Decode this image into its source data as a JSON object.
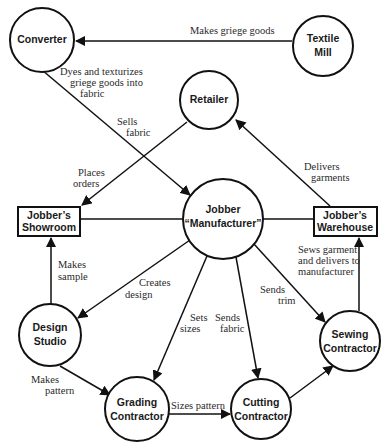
{
  "diagram": {
    "type": "flow-network",
    "nodes": {
      "converter": {
        "lines": [
          "Converter"
        ],
        "shape": "circle"
      },
      "textile_mill": {
        "lines": [
          "Textile",
          "Mill"
        ],
        "shape": "circle"
      },
      "retailer": {
        "lines": [
          "Retailer"
        ],
        "shape": "circle"
      },
      "jobber_manufacturer": {
        "lines": [
          "Jobber",
          "“Manufacturer”"
        ],
        "shape": "circle"
      },
      "jobbers_showroom": {
        "lines": [
          "Jobber’s",
          "Showroom"
        ],
        "shape": "rectangle"
      },
      "jobbers_warehouse": {
        "lines": [
          "Jobber’s",
          "Warehouse"
        ],
        "shape": "rectangle"
      },
      "design_studio": {
        "lines": [
          "Design",
          "Studio"
        ],
        "shape": "circle"
      },
      "grading_contractor": {
        "lines": [
          "Grading",
          "Contractor"
        ],
        "shape": "circle"
      },
      "cutting_contractor": {
        "lines": [
          "Cutting",
          "Contractor"
        ],
        "shape": "circle"
      },
      "sewing_contractor": {
        "lines": [
          "Sewing",
          "Contractor"
        ],
        "shape": "circle"
      }
    },
    "edges": {
      "makes_griege": {
        "from": "textile_mill",
        "to": "converter",
        "lines": [
          "Makes griege goods"
        ]
      },
      "dyes": {
        "from": "converter",
        "to": "jobber_manufacturer",
        "lines": [
          "Dyes and texturizes",
          "griege goods into",
          "fabric"
        ]
      },
      "sells_fabric": {
        "from": "converter",
        "to": "jobber_manufacturer",
        "lines": [
          "Sells",
          "fabric"
        ]
      },
      "places_orders": {
        "from": "retailer",
        "to": "jobbers_showroom",
        "lines": [
          "Places",
          "orders"
        ]
      },
      "delivers_garments": {
        "from": "jobbers_warehouse",
        "to": "retailer",
        "lines": [
          "Delivers",
          "garments"
        ]
      },
      "makes_sample": {
        "from": "design_studio",
        "to": "jobbers_showroom",
        "lines": [
          "Makes",
          "sample"
        ]
      },
      "creates_design": {
        "from": "jobber_manufacturer",
        "to": "design_studio",
        "lines": [
          "Creates",
          "design"
        ]
      },
      "sets_sizes": {
        "from": "jobber_manufacturer",
        "to": "grading_contractor",
        "lines": [
          "Sets",
          "sizes"
        ]
      },
      "sends_fabric": {
        "from": "jobber_manufacturer",
        "to": "cutting_contractor",
        "lines": [
          "Sends",
          "fabric"
        ]
      },
      "sends_trim": {
        "from": "jobber_manufacturer",
        "to": "sewing_contractor",
        "lines": [
          "Sends",
          "trim"
        ]
      },
      "sews_garment": {
        "from": "sewing_contractor",
        "to": "jobbers_warehouse",
        "lines": [
          "Sews garment",
          "and delivers to",
          "manufacturer"
        ]
      },
      "makes_pattern": {
        "from": "design_studio",
        "to": "grading_contractor",
        "lines": [
          "Makes",
          "pattern"
        ]
      },
      "sizes_pattern": {
        "from": "grading_contractor",
        "to": "cutting_contractor",
        "lines": [
          "Sizes pattern"
        ]
      },
      "cutting_to_sewing": {
        "from": "cutting_contractor",
        "to": "sewing_contractor",
        "lines": []
      },
      "showroom_link": {
        "from": "jobbers_showroom",
        "to": "jobber_manufacturer",
        "lines": []
      },
      "warehouse_link": {
        "from": "jobber_manufacturer",
        "to": "jobbers_warehouse",
        "lines": []
      }
    }
  }
}
